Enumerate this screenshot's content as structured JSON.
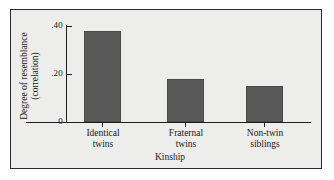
{
  "figure": {
    "background_color": "#ffffff",
    "panel_color": "#ededeb",
    "panel_border_color": "#2b2b2b",
    "axis_color": "#1e1e1e"
  },
  "chart_data": {
    "type": "bar",
    "title": "",
    "categories": [
      "Identical twins",
      "Fraternal twins",
      "Non-twin siblings"
    ],
    "category_lines": [
      [
        "Identical",
        "twins"
      ],
      [
        "Fraternal",
        "twins"
      ],
      [
        "Non-twin",
        "siblings"
      ]
    ],
    "values": [
      0.38,
      0.18,
      0.15
    ],
    "xlabel": "Kinship",
    "ylabel": "Degree of resemblance (correlation)",
    "ylabel_lines": [
      "Degree of resemblance",
      "(correlation)"
    ],
    "ylim": [
      0,
      0.44
    ],
    "yticks": [
      0,
      0.2,
      0.4
    ],
    "ytick_labels": [
      "0",
      ".20",
      ".40"
    ],
    "grid": false,
    "legend": false,
    "bar_color": "#595959"
  }
}
